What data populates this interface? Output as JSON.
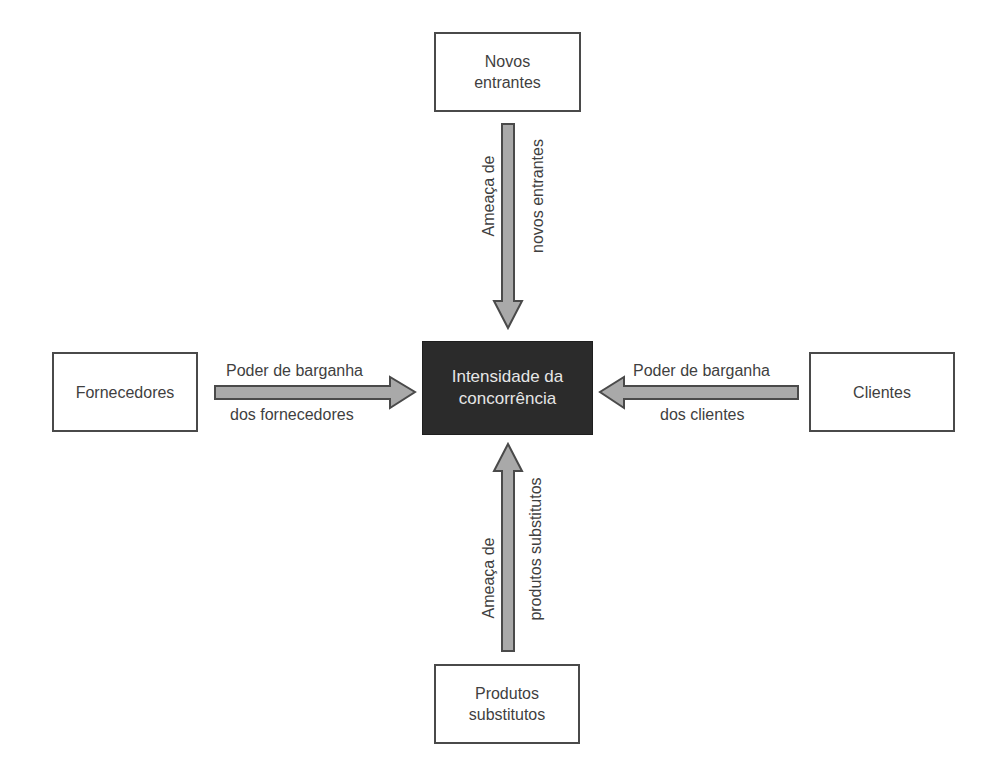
{
  "diagram": {
    "center": {
      "line1": "Intensidade da",
      "line2": "concorrência"
    },
    "top_box": {
      "line1": "Novos",
      "line2": "entrantes"
    },
    "left_box": {
      "label": "Fornecedores"
    },
    "right_box": {
      "label": "Clientes"
    },
    "bottom_box": {
      "line1": "Produtos",
      "line2": "substitutos"
    },
    "arrows": {
      "top": {
        "line1": "Ameaça de",
        "line2": "novos entrantes",
        "direction": "down"
      },
      "left": {
        "line1": "Poder de barganha",
        "line2": "dos fornecedores",
        "direction": "right"
      },
      "right": {
        "line1": "Poder de barganha",
        "line2": "dos clientes",
        "direction": "left"
      },
      "bottom": {
        "line1": "Ameaça de",
        "line2": "produtos substitutos",
        "direction": "up"
      }
    },
    "colors": {
      "arrow_fill": "#a9a9a9",
      "arrow_stroke": "#4a4a4a",
      "center_fill": "#2b2b2b",
      "box_border": "#4a4a4a"
    }
  }
}
